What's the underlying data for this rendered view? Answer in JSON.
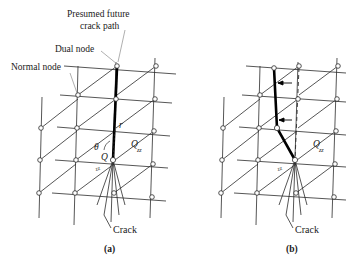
{
  "figure": {
    "title_annotations": {
      "presumed_path_line1": "Presumed future",
      "presumed_path_line2": "crack path",
      "dual_node": "Dual node",
      "normal_node": "Normal node"
    },
    "panels": [
      {
        "id": "a",
        "caption": "(a)",
        "crack_label": "Crack",
        "math_labels": {
          "radius": "r",
          "angle": "θ",
          "quantity": "Q",
          "quantity_sub": "zz",
          "tip_label_sub": "zz"
        },
        "crack_path_type": "straight-vertical",
        "has_dashed_reference": false,
        "has_shift_arrows": false
      },
      {
        "id": "b",
        "caption": "(b)",
        "crack_label": "Crack",
        "math_labels": {
          "quantity": "Q",
          "quantity_sub": "zz",
          "tip_label_sub": "zz"
        },
        "crack_path_type": "kinked-deflected",
        "has_dashed_reference": true,
        "has_shift_arrows": true,
        "arrow_count": 2
      }
    ],
    "colors": {
      "background": "#ffffff",
      "mesh_line": "#2b2b2b",
      "crack_path": "#000000",
      "leader_line": "#9a9a9a",
      "text": "#1a1a1a",
      "node_fill": "#ffffff"
    }
  }
}
